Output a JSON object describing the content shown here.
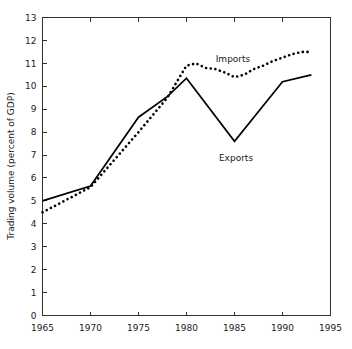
{
  "chart_data": {
    "type": "line",
    "title": "",
    "subtitle": "",
    "xlabel": "",
    "ylabel": "Trading volume  (percent of GDP)",
    "xlim": [
      1965,
      1995
    ],
    "ylim": [
      0,
      13
    ],
    "xticks": [
      1965,
      1970,
      1975,
      1980,
      1985,
      1990,
      1995
    ],
    "yticks": [
      0,
      1,
      2,
      3,
      4,
      5,
      6,
      7,
      8,
      9,
      10,
      11,
      12,
      13
    ],
    "grid": false,
    "legend_position": "inline-annotations",
    "series": [
      {
        "name": "Imports",
        "style": "dotted",
        "color": "#000000",
        "annotation": "Imports",
        "x": [
          1965,
          1970,
          1975,
          1978,
          1980,
          1981,
          1982,
          1983,
          1984,
          1985,
          1986,
          1987,
          1988,
          1989,
          1990,
          1991,
          1992,
          1993
        ],
        "values": [
          4.5,
          5.6,
          8.0,
          9.5,
          10.9,
          11.0,
          10.8,
          10.75,
          10.6,
          10.4,
          10.5,
          10.75,
          10.9,
          11.1,
          11.25,
          11.4,
          11.5,
          11.5
        ]
      },
      {
        "name": "Exports",
        "style": "solid",
        "color": "#000000",
        "annotation": "Exports",
        "x": [
          1965,
          1970,
          1975,
          1978,
          1980,
          1985,
          1990,
          1993
        ],
        "values": [
          5.0,
          5.65,
          8.65,
          9.55,
          10.35,
          7.6,
          10.2,
          10.5
        ]
      }
    ]
  },
  "annotations": {
    "imports_label": "Imports",
    "exports_label": "Exports"
  },
  "axes": {
    "y_title": "Trading volume  (percent of GDP)",
    "y_tick_labels": [
      "0",
      "1",
      "2",
      "3",
      "4",
      "5",
      "6",
      "7",
      "8",
      "9",
      "10",
      "11",
      "12",
      "13"
    ],
    "x_tick_labels": [
      "1965",
      "1970",
      "1975",
      "1980",
      "1985",
      "1990",
      "1995"
    ]
  },
  "colors": {
    "axis": "#333333",
    "series": "#000000",
    "background": "#ffffff"
  }
}
